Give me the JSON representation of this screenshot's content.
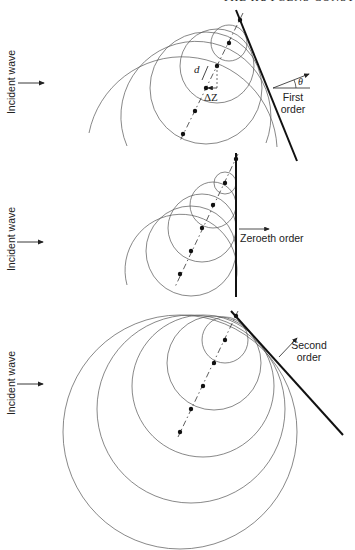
{
  "header": {
    "text": "THE HUYGENS CONST"
  },
  "panels": [
    {
      "id": "first-order",
      "incident_label": "Incident wave",
      "order_label_line1": "First",
      "order_label_line2": "order",
      "angle_symbol": "θ",
      "spacing_label": "d",
      "offset_label": "ΔZ"
    },
    {
      "id": "zeroeth-order",
      "incident_label": "Incident wave",
      "order_label": "Zeroeth order"
    },
    {
      "id": "second-order",
      "incident_label": "Incident wave",
      "order_label_line1": "Second",
      "order_label_line2": "order"
    }
  ],
  "colors": {
    "ink": "#1a1a1a",
    "thin_line": "#555555"
  }
}
